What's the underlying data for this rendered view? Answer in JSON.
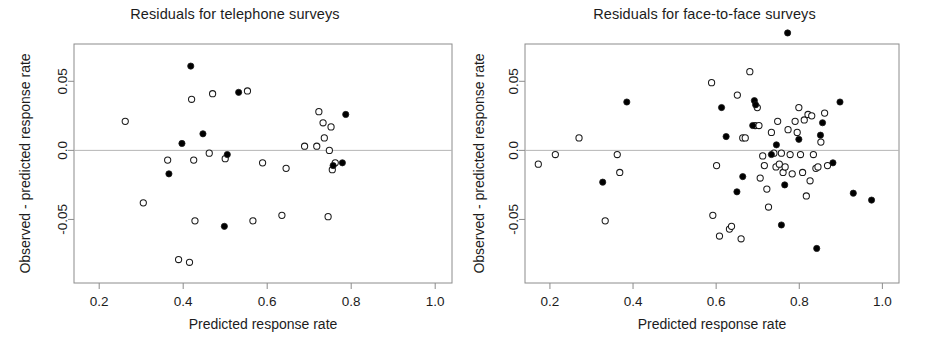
{
  "figure": {
    "background": "#ffffff",
    "point_fill_color": "#000000",
    "point_open_color": "#ffffff",
    "point_stroke_color": "#1a1a1a",
    "frame_color": "#8c8c8c",
    "zero_line_color": "#b5b5b5"
  },
  "chart_data": [
    {
      "type": "scatter",
      "title": "Residuals for telephone surveys",
      "xlabel": "Predicted response rate",
      "ylabel": "Observed - predicted response rate",
      "xlim": [
        0.14,
        1.04
      ],
      "ylim": [
        -0.096,
        0.077
      ],
      "xticks": [
        0.2,
        0.4,
        0.6,
        0.8,
        1.0
      ],
      "xtick_labels": [
        "0.2",
        "0.4",
        "0.6",
        "0.8",
        "1.0"
      ],
      "yticks": [
        -0.05,
        0.0,
        0.05
      ],
      "ytick_labels": [
        "-0.05",
        "0.0",
        "0.05"
      ],
      "grid": false,
      "legend": "none",
      "reference_line_y": 0.0,
      "series": [
        {
          "name": "open circles",
          "marker": "open",
          "points": [
            [
              0.262,
              0.021
            ],
            [
              0.305,
              -0.038
            ],
            [
              0.363,
              -0.007
            ],
            [
              0.389,
              -0.079
            ],
            [
              0.415,
              -0.081
            ],
            [
              0.42,
              0.037
            ],
            [
              0.425,
              -0.007
            ],
            [
              0.428,
              -0.051
            ],
            [
              0.462,
              -0.002
            ],
            [
              0.47,
              0.041
            ],
            [
              0.5,
              -0.006
            ],
            [
              0.553,
              0.043
            ],
            [
              0.566,
              -0.051
            ],
            [
              0.589,
              -0.009
            ],
            [
              0.635,
              -0.047
            ],
            [
              0.645,
              -0.013
            ],
            [
              0.689,
              0.003
            ],
            [
              0.718,
              0.003
            ],
            [
              0.723,
              0.028
            ],
            [
              0.733,
              0.02
            ],
            [
              0.736,
              0.009
            ],
            [
              0.745,
              -0.048
            ],
            [
              0.748,
              0.0
            ],
            [
              0.752,
              0.017
            ],
            [
              0.755,
              -0.014
            ],
            [
              0.762,
              -0.009
            ]
          ]
        },
        {
          "name": "filled circles",
          "marker": "filled",
          "points": [
            [
              0.366,
              -0.017
            ],
            [
              0.397,
              0.005
            ],
            [
              0.418,
              0.061
            ],
            [
              0.447,
              0.012
            ],
            [
              0.498,
              -0.055
            ],
            [
              0.505,
              -0.003
            ],
            [
              0.532,
              0.042
            ],
            [
              0.757,
              -0.011
            ],
            [
              0.779,
              -0.009
            ],
            [
              0.787,
              0.026
            ]
          ]
        }
      ]
    },
    {
      "type": "scatter",
      "title": "Residuals for face-to-face surveys",
      "xlabel": "Predicted response rate",
      "ylabel": "Observed - predicted response rate",
      "xlim": [
        0.14,
        1.04
      ],
      "ylim": [
        -0.096,
        0.077
      ],
      "xticks": [
        0.2,
        0.4,
        0.6,
        0.8,
        1.0
      ],
      "xtick_labels": [
        "0.2",
        "0.4",
        "0.6",
        "0.8",
        "1.0"
      ],
      "yticks": [
        -0.05,
        0.0,
        0.05
      ],
      "ytick_labels": [
        "-0.05",
        "0.0",
        "0.05"
      ],
      "grid": false,
      "legend": "none",
      "reference_line_y": 0.0,
      "series": [
        {
          "name": "open circles",
          "marker": "open",
          "points": [
            [
              0.172,
              -0.01
            ],
            [
              0.213,
              -0.003
            ],
            [
              0.27,
              0.009
            ],
            [
              0.333,
              -0.051
            ],
            [
              0.362,
              -0.003
            ],
            [
              0.368,
              -0.016
            ],
            [
              0.589,
              0.049
            ],
            [
              0.592,
              -0.047
            ],
            [
              0.601,
              -0.011
            ],
            [
              0.608,
              -0.062
            ],
            [
              0.632,
              -0.057
            ],
            [
              0.637,
              -0.055
            ],
            [
              0.651,
              0.04
            ],
            [
              0.66,
              -0.064
            ],
            [
              0.664,
              0.009
            ],
            [
              0.67,
              0.009
            ],
            [
              0.681,
              0.057
            ],
            [
              0.694,
              0.018
            ],
            [
              0.699,
              0.031
            ],
            [
              0.703,
              0.018
            ],
            [
              0.706,
              -0.02
            ],
            [
              0.712,
              -0.004
            ],
            [
              0.716,
              -0.011
            ],
            [
              0.722,
              -0.028
            ],
            [
              0.726,
              -0.041
            ],
            [
              0.733,
              0.013
            ],
            [
              0.739,
              -0.002
            ],
            [
              0.744,
              -0.012
            ],
            [
              0.748,
              0.021
            ],
            [
              0.752,
              -0.01
            ],
            [
              0.757,
              -0.002
            ],
            [
              0.761,
              -0.016
            ],
            [
              0.766,
              -0.012
            ],
            [
              0.773,
              0.015
            ],
            [
              0.778,
              -0.003
            ],
            [
              0.783,
              -0.017
            ],
            [
              0.79,
              0.021
            ],
            [
              0.795,
              0.013
            ],
            [
              0.799,
              0.031
            ],
            [
              0.803,
              -0.003
            ],
            [
              0.808,
              -0.016
            ],
            [
              0.812,
              0.022
            ],
            [
              0.817,
              -0.033
            ],
            [
              0.821,
              0.026
            ],
            [
              0.826,
              -0.022
            ],
            [
              0.83,
              0.025
            ],
            [
              0.834,
              -0.003
            ],
            [
              0.84,
              -0.013
            ],
            [
              0.845,
              -0.012
            ],
            [
              0.852,
              0.006
            ],
            [
              0.861,
              0.027
            ],
            [
              0.868,
              -0.011
            ]
          ]
        },
        {
          "name": "filled circles",
          "marker": "filled",
          "points": [
            [
              0.327,
              -0.023
            ],
            [
              0.385,
              0.035
            ],
            [
              0.613,
              0.031
            ],
            [
              0.624,
              0.01
            ],
            [
              0.65,
              -0.03
            ],
            [
              0.664,
              -0.019
            ],
            [
              0.688,
              0.018
            ],
            [
              0.692,
              0.036
            ],
            [
              0.695,
              0.033
            ],
            [
              0.733,
              -0.003
            ],
            [
              0.745,
              0.004
            ],
            [
              0.757,
              -0.054
            ],
            [
              0.765,
              -0.025
            ],
            [
              0.772,
              0.085
            ],
            [
              0.799,
              0.008
            ],
            [
              0.842,
              -0.071
            ],
            [
              0.851,
              0.011
            ],
            [
              0.856,
              0.02
            ],
            [
              0.881,
              -0.009
            ],
            [
              0.898,
              0.035
            ],
            [
              0.93,
              -0.031
            ],
            [
              0.974,
              -0.036
            ]
          ]
        }
      ]
    }
  ]
}
